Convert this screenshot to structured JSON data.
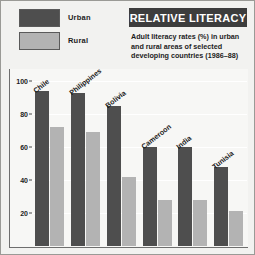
{
  "legend": {
    "items": [
      {
        "label": "Urban",
        "color": "#4e4e4e",
        "name": "urban"
      },
      {
        "label": "Rural",
        "color": "#b3b3b3",
        "name": "rural"
      }
    ]
  },
  "header": {
    "title": "RELATIVE LITERACY",
    "subtitle": "Adult literacy rates (%) in urban and rural areas of selected developing countries (1986–88)"
  },
  "chart_data": {
    "type": "bar",
    "title": "RELATIVE LITERACY",
    "subtitle": "Adult literacy rates (%) in urban and rural areas of selected developing countries (1986–88)",
    "xlabel": "",
    "ylabel": "",
    "ylim": [
      0,
      100
    ],
    "yticks": [
      20,
      40,
      60,
      80,
      100
    ],
    "ytick_labels": [
      "20",
      "40",
      "60",
      "80",
      "100"
    ],
    "grid": true,
    "legend_position": "top-left",
    "categories": [
      "Chile",
      "Philippines",
      "Bolivia",
      "Cameroon",
      "India",
      "Tunisia"
    ],
    "series": [
      {
        "name": "Urban",
        "color": "#4e4e4e",
        "values": [
          94,
          93,
          85,
          60,
          60,
          48
        ]
      },
      {
        "name": "Rural",
        "color": "#b3b3b3",
        "values": [
          72,
          69,
          42,
          28,
          28,
          21
        ]
      }
    ]
  }
}
